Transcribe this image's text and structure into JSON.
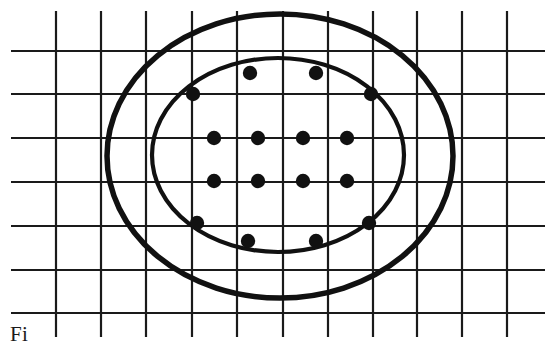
{
  "figure": {
    "caption_text": "Fi",
    "background_color": "#ffffff",
    "ink_color": "#111111"
  },
  "chart_data": {
    "type": "scatter",
    "title": "",
    "subtitle": "",
    "xlabel": "",
    "ylabel": "",
    "xlim": [
      0,
      11
    ],
    "ylim": [
      0,
      7
    ],
    "grid": true,
    "legend_position": "none",
    "grid_spec": {
      "vertical_line_count": 11,
      "horizontal_line_count": 7,
      "vertical_x": [
        56,
        101,
        146,
        192,
        237,
        283,
        328,
        373,
        417,
        462,
        507
      ],
      "horizontal_y": [
        51,
        94,
        138,
        182,
        226,
        270,
        313
      ],
      "vertical_span_y": [
        11,
        337
      ],
      "horizontal_span_x": [
        11,
        545
      ],
      "line_color": "#1a1a1a",
      "line_width": 2.2
    },
    "series": [
      {
        "name": "sample points",
        "marker": "filled-circle",
        "marker_radius": 7.2,
        "color": "#111111",
        "points": [
          {
            "x": 250,
            "y": 73,
            "grid": "col5,row-between1-2"
          },
          {
            "x": 316,
            "y": 73,
            "grid": "col6,row-between1-2"
          },
          {
            "x": 193,
            "y": 94,
            "grid": "col4,row2"
          },
          {
            "x": 371,
            "y": 94,
            "grid": "col8,row2"
          },
          {
            "x": 214,
            "y": 138,
            "grid": "col4-5,row3"
          },
          {
            "x": 258,
            "y": 138,
            "grid": "col5-6,row3"
          },
          {
            "x": 303,
            "y": 138,
            "grid": "col6-7,row3"
          },
          {
            "x": 347,
            "y": 138,
            "grid": "col7-8,row3"
          },
          {
            "x": 214,
            "y": 181,
            "grid": "col4-5,row4"
          },
          {
            "x": 258,
            "y": 181,
            "grid": "col5-6,row4"
          },
          {
            "x": 303,
            "y": 181,
            "grid": "col6-7,row4"
          },
          {
            "x": 347,
            "y": 181,
            "grid": "col7-8,row4"
          },
          {
            "x": 197,
            "y": 223,
            "grid": "col4,row5"
          },
          {
            "x": 369,
            "y": 223,
            "grid": "col8,row5"
          },
          {
            "x": 248,
            "y": 241,
            "grid": "col5,row-between5-6"
          },
          {
            "x": 316,
            "y": 241,
            "grid": "col6,row-between5-6"
          }
        ]
      }
    ],
    "contours": [
      {
        "name": "outer-ellipse",
        "shape": "ellipse",
        "cx": 280,
        "cy": 156,
        "rx": 173,
        "ry": 142,
        "rotation_deg": 0,
        "stroke_color": "#111111",
        "stroke_width": 5.5,
        "fill": "none"
      },
      {
        "name": "inner-ellipse",
        "shape": "ellipse",
        "cx": 278,
        "cy": 155,
        "rx": 126,
        "ry": 97,
        "rotation_deg": 0,
        "stroke_color": "#111111",
        "stroke_width": 4.2,
        "fill": "none"
      }
    ],
    "point_count": 16,
    "contour_count": 2
  }
}
